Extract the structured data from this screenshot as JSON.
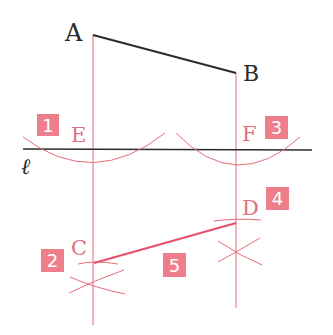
{
  "figure": {
    "type": "geometric-construction",
    "colors": {
      "ink": "#2b2b2b",
      "construction": "#e86b7a",
      "result_segment": "#e8506a",
      "step_box": "#ef7e8c",
      "step_text": "#ffffff",
      "label_red": "#e0707e"
    },
    "points": {
      "A": {
        "label": "A",
        "x": 93,
        "y": 35
      },
      "B": {
        "label": "B",
        "x": 236,
        "y": 73
      },
      "E": {
        "label": "E",
        "x": 93,
        "y": 149
      },
      "F": {
        "label": "F",
        "x": 236,
        "y": 150
      },
      "C": {
        "label": "C",
        "x": 94,
        "y": 263
      },
      "D": {
        "label": "D",
        "x": 236,
        "y": 223
      }
    },
    "line_label": "ℓ",
    "steps": [
      {
        "num": "1",
        "x": 37,
        "y": 114
      },
      {
        "num": "2",
        "x": 41,
        "y": 249
      },
      {
        "num": "3",
        "x": 265,
        "y": 116
      },
      {
        "num": "4",
        "x": 266,
        "y": 187
      },
      {
        "num": "5",
        "x": 163,
        "y": 253
      }
    ]
  }
}
